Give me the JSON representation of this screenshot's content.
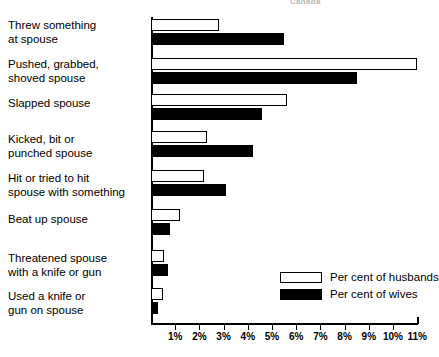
{
  "header": {
    "cutoff_text": "Canada"
  },
  "legend": {
    "position": "bottom-right",
    "items": [
      {
        "label": "Per cent of husbands",
        "swatch": "white-outline"
      },
      {
        "label": "Per cent of wives",
        "swatch": "black-filled"
      }
    ]
  },
  "axis": {
    "tick_labels": [
      "1%",
      "2%",
      "3%",
      "4%",
      "5%",
      "6%",
      "7%",
      "8%",
      "9%",
      "10%",
      "11%"
    ]
  },
  "chart_data": {
    "type": "bar",
    "orientation": "horizontal",
    "title": "",
    "subtitle": "",
    "xlabel": "",
    "ylabel": "",
    "xlim": [
      0,
      11
    ],
    "xticks": [
      1,
      2,
      3,
      4,
      5,
      6,
      7,
      8,
      9,
      10,
      11
    ],
    "xtick_labels": [
      "1%",
      "2%",
      "3%",
      "4%",
      "5%",
      "6%",
      "7%",
      "8%",
      "9%",
      "10%",
      "11%"
    ],
    "grid": false,
    "legend_position": "lower right",
    "categories": [
      "Threw something\nat spouse",
      "Pushed, grabbed,\nshoved spouse",
      "Slapped spouse",
      "Kicked, bit or\npunched spouse",
      "Hit or tried to hit\nspouse with something",
      "Beat up spouse",
      "Threatened spouse\nwith a knife or gun",
      "Used a knife or\ngun on spouse"
    ],
    "series": [
      {
        "name": "Per cent of husbands",
        "color": "#ffffff",
        "values": [
          2.8,
          11.0,
          5.6,
          2.3,
          2.2,
          1.2,
          0.55,
          0.5
        ]
      },
      {
        "name": "Per cent of wives",
        "color": "#000000",
        "values": [
          5.5,
          8.5,
          4.6,
          4.2,
          3.1,
          0.8,
          0.7,
          0.3
        ]
      }
    ]
  }
}
